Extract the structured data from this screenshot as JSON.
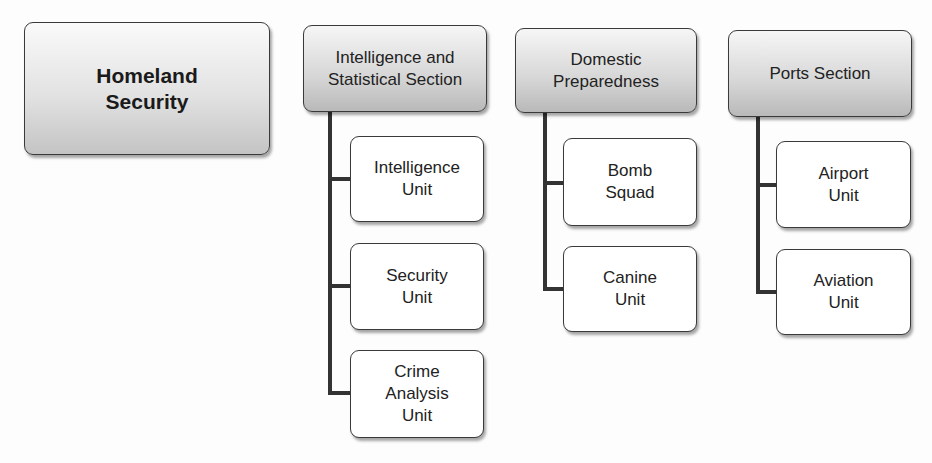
{
  "root": {
    "label": "Homeland\nSecurity"
  },
  "sections": [
    {
      "label": "Intelligence and\nStatistical Section",
      "units": [
        {
          "label": "Intelligence\nUnit"
        },
        {
          "label": "Security\nUnit"
        },
        {
          "label": "Crime\nAnalysis\nUnit"
        }
      ]
    },
    {
      "label": "Domestic\nPreparedness",
      "units": [
        {
          "label": "Bomb\nSquad"
        },
        {
          "label": "Canine\nUnit"
        }
      ]
    },
    {
      "label": "Ports Section",
      "units": [
        {
          "label": "Airport\nUnit"
        },
        {
          "label": "Aviation\nUnit"
        }
      ]
    }
  ]
}
